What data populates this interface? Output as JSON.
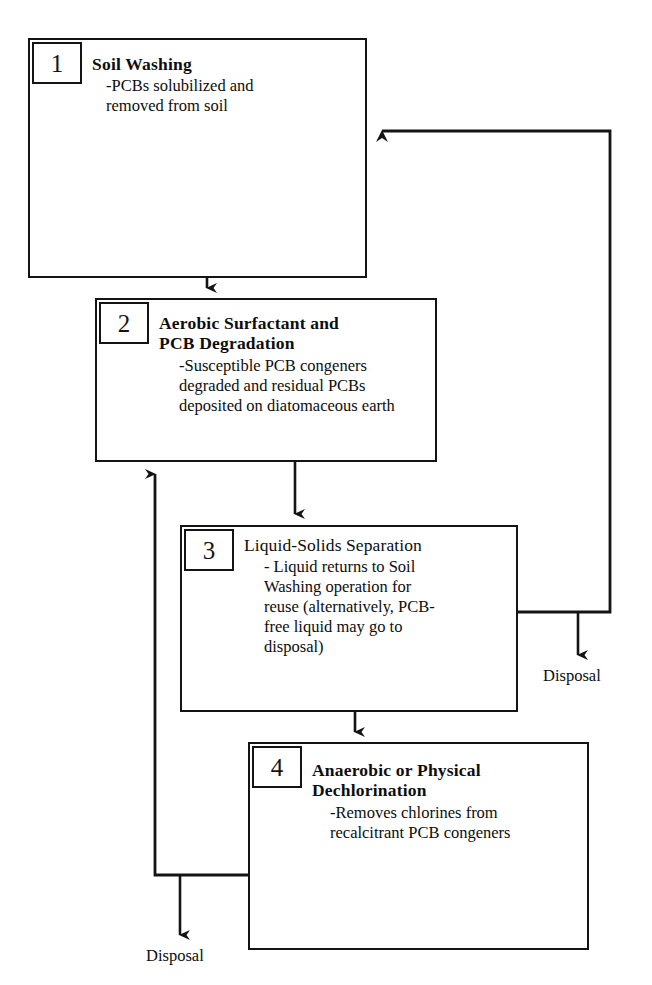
{
  "diagram": {
    "type": "process-flow",
    "line_color": "#141414",
    "background_color": "#ffffff"
  },
  "stages": [
    {
      "number": "1",
      "title": "Soil Washing",
      "title_bold": true,
      "description": "-PCBs solubilized and\nremoved from soil"
    },
    {
      "number": "2",
      "title": "Aerobic Surfactant and\nPCB Degradation",
      "title_bold": true,
      "description": "-Susceptible PCB congeners\ndegraded and residual  PCBs\ndeposited on diatomaceous earth"
    },
    {
      "number": "3",
      "title": "Liquid-Solids Separation",
      "title_bold": false,
      "description": "- Liquid returns to Soil\nWashing operation for\nreuse (alternatively, PCB-\nfree liquid may go to\ndisposal)"
    },
    {
      "number": "4",
      "title": "Anaerobic or Physical\nDechlorination",
      "title_bold": true,
      "description": "-Removes chlorines from\nrecalcitrant PCB congeners"
    }
  ],
  "outputs": {
    "disposal_right_label": "Disposal",
    "disposal_bottom_label": "Disposal"
  },
  "connections": [
    {
      "name": "stage1-to-stage2",
      "from": "1",
      "to": "2",
      "style": "down-arrow"
    },
    {
      "name": "stage2-to-stage3",
      "from": "2",
      "to": "3",
      "style": "down-arrow"
    },
    {
      "name": "stage3-to-stage4",
      "from": "3",
      "to": "4",
      "style": "down-arrow"
    },
    {
      "name": "stage3-recycle-to-stage1",
      "from": "3",
      "to": "1",
      "style": "right-up-left-arrow"
    },
    {
      "name": "stage3-to-disposal",
      "from": "3",
      "to": "disposal-right",
      "style": "down-arrow"
    },
    {
      "name": "stage4-return-to-stage2",
      "from": "4",
      "to": "2",
      "style": "left-up-arrow"
    },
    {
      "name": "stage4-to-disposal",
      "from": "4",
      "to": "disposal-bottom",
      "style": "down-arrow"
    }
  ]
}
